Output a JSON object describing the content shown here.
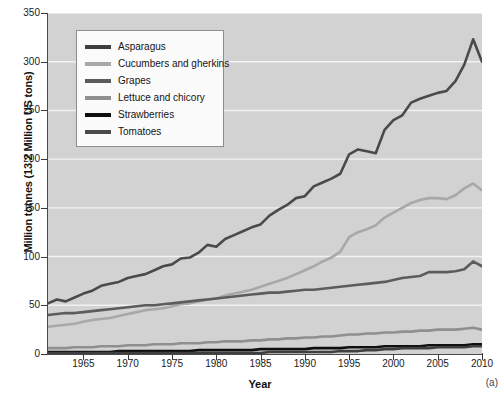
{
  "chart_data": {
    "type": "line",
    "title": "",
    "xlabel": "Year",
    "ylabel": "Million tonnes (13.2 Million US tons)",
    "panel_label": "(a)",
    "grid": true,
    "legend_position": "top-left",
    "xlim": [
      1961,
      2010
    ],
    "ylim": [
      0,
      350
    ],
    "xticks": [
      1965,
      1970,
      1975,
      1980,
      1985,
      1990,
      1995,
      2000,
      2005,
      2010
    ],
    "yticks": [
      0,
      50,
      100,
      150,
      200,
      250,
      300,
      350
    ],
    "x": [
      1961,
      1962,
      1963,
      1964,
      1965,
      1966,
      1967,
      1968,
      1969,
      1970,
      1971,
      1972,
      1973,
      1974,
      1975,
      1976,
      1977,
      1978,
      1979,
      1980,
      1981,
      1982,
      1983,
      1984,
      1985,
      1986,
      1987,
      1988,
      1989,
      1990,
      1991,
      1992,
      1993,
      1994,
      1995,
      1996,
      1997,
      1998,
      1999,
      2000,
      2001,
      2002,
      2003,
      2004,
      2005,
      2006,
      2007,
      2008,
      2009,
      2010
    ],
    "series": [
      {
        "name": "Tomatoes",
        "color": "#4a4a4a",
        "values": [
          52,
          56,
          54,
          58,
          62,
          65,
          70,
          72,
          74,
          78,
          80,
          82,
          86,
          90,
          92,
          98,
          99,
          104,
          112,
          110,
          118,
          122,
          126,
          130,
          133,
          142,
          148,
          153,
          160,
          162,
          172,
          176,
          180,
          185,
          205,
          210,
          208,
          206,
          230,
          240,
          245,
          258,
          262,
          265,
          268,
          270,
          280,
          297,
          323,
          300
        ]
      },
      {
        "name": "Cucumbers and gherkins",
        "color": "#a8a8a8",
        "values": [
          28,
          29,
          30,
          31,
          33,
          35,
          36,
          37,
          39,
          41,
          43,
          45,
          46,
          47,
          49,
          51,
          52,
          54,
          56,
          57,
          60,
          62,
          64,
          66,
          69,
          72,
          75,
          78,
          82,
          86,
          90,
          95,
          99,
          105,
          120,
          125,
          128,
          132,
          140,
          145,
          150,
          155,
          158,
          160,
          160,
          159,
          163,
          170,
          175,
          168
        ]
      },
      {
        "name": "Grapes",
        "color": "#5c5c5c",
        "values": [
          40,
          41,
          42,
          42,
          43,
          44,
          45,
          46,
          47,
          48,
          49,
          50,
          50,
          51,
          52,
          53,
          54,
          55,
          56,
          57,
          58,
          59,
          60,
          61,
          62,
          63,
          63,
          64,
          65,
          66,
          66,
          67,
          68,
          69,
          70,
          71,
          72,
          73,
          74,
          76,
          78,
          79,
          80,
          84,
          84,
          84,
          85,
          87,
          95,
          90
        ]
      },
      {
        "name": "Lettuce and chicory",
        "color": "#8f8f8f",
        "values": [
          6,
          6,
          6,
          7,
          7,
          7,
          8,
          8,
          8,
          9,
          9,
          9,
          10,
          10,
          10,
          11,
          11,
          11,
          12,
          12,
          13,
          13,
          13,
          14,
          14,
          15,
          15,
          16,
          16,
          17,
          17,
          18,
          18,
          19,
          20,
          20,
          21,
          21,
          22,
          22,
          23,
          23,
          24,
          24,
          25,
          25,
          25,
          26,
          27,
          25
        ]
      },
      {
        "name": "Strawberries",
        "color": "#0f0f0f",
        "values": [
          2,
          2,
          2,
          2,
          2,
          2,
          2,
          2,
          3,
          3,
          3,
          3,
          3,
          3,
          3,
          3,
          3,
          4,
          4,
          4,
          4,
          4,
          4,
          4,
          5,
          5,
          5,
          5,
          5,
          5,
          6,
          6,
          6,
          6,
          7,
          7,
          7,
          7,
          8,
          8,
          8,
          8,
          8,
          9,
          9,
          9,
          9,
          9,
          10,
          10
        ]
      },
      {
        "name": "Asparagus",
        "color": "#3f3f3f",
        "values": [
          1,
          1,
          1,
          1,
          1,
          1,
          1,
          1,
          1,
          1,
          1,
          1,
          1,
          1,
          1,
          1,
          1,
          1,
          1,
          1,
          1,
          1,
          1,
          1,
          1,
          2,
          2,
          2,
          2,
          2,
          2,
          2,
          2,
          3,
          3,
          3,
          4,
          4,
          5,
          5,
          6,
          6,
          6,
          6,
          7,
          7,
          7,
          7,
          8,
          8
        ]
      }
    ],
    "legend_order": [
      {
        "name": "Asparagus",
        "color": "#3f3f3f"
      },
      {
        "name": "Cucumbers and gherkins",
        "color": "#a8a8a8"
      },
      {
        "name": "Grapes",
        "color": "#5c5c5c"
      },
      {
        "name": "Lettuce and chicory",
        "color": "#8f8f8f"
      },
      {
        "name": "Strawberries",
        "color": "#0f0f0f"
      },
      {
        "name": "Tomatoes",
        "color": "#4a4a4a"
      }
    ],
    "plot_background": "#d2d2d2",
    "gridline_color": "#f2f2f2"
  }
}
